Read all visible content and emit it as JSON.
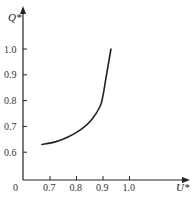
{
  "chart_data": {
    "type": "line",
    "title": "",
    "xlabel": "U*",
    "ylabel": "Q*",
    "origin_label": "0",
    "xlim": [
      0.6,
      1.1
    ],
    "ylim": [
      0.5,
      1.05
    ],
    "x_ticks": [
      0.7,
      0.8,
      0.9,
      1.0
    ],
    "x_tick_labels": [
      "0.7",
      "0.8",
      "0.9",
      "1.0"
    ],
    "y_ticks": [
      0.6,
      0.7,
      0.8,
      0.9,
      1.0
    ],
    "y_tick_labels": [
      "0.6",
      "0.7",
      "0.8",
      "0.9",
      "1.0"
    ],
    "grid": false,
    "legend": null,
    "series": [
      {
        "name": "Q* vs U*",
        "color": "#222222",
        "x": [
          0.67,
          0.72,
          0.77,
          0.82,
          0.86,
          0.89,
          0.9,
          0.91,
          0.92,
          0.93
        ],
        "y": [
          0.63,
          0.64,
          0.66,
          0.69,
          0.73,
          0.78,
          0.82,
          0.88,
          0.94,
          1.0
        ]
      }
    ]
  }
}
